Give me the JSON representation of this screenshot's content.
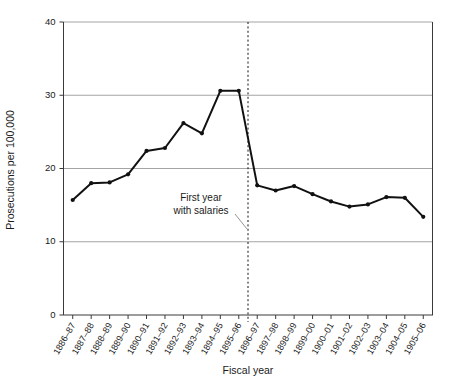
{
  "chart_data": {
    "type": "line",
    "title": "",
    "xlabel": "Fiscal year",
    "ylabel": "Prosecutions per 100,000",
    "ylim": [
      0,
      40
    ],
    "yticks": [
      0,
      10,
      20,
      30,
      40
    ],
    "ytick_labels": [
      "0",
      "10",
      "20",
      "30",
      "40"
    ],
    "grid": "horizontal",
    "legend": "none",
    "categories": [
      "1886–87",
      "1887–88",
      "1888–89",
      "1889–90",
      "1890–91",
      "1891–92",
      "1892–93",
      "1893–94",
      "1894–95",
      "1895–96",
      "1896–97",
      "1897–98",
      "1898–99",
      "1899–00",
      "1900–01",
      "1901–02",
      "1902–03",
      "1903–04",
      "1904–05",
      "1905–06"
    ],
    "values": [
      15.7,
      18.0,
      18.1,
      19.2,
      22.4,
      22.8,
      26.2,
      24.8,
      30.6,
      30.6,
      17.7,
      17.0,
      17.6,
      16.5,
      15.5,
      14.8,
      15.1,
      16.1,
      16.0,
      13.4
    ],
    "annotations": [
      {
        "name": "first-year-with-salaries",
        "line1": "First year",
        "line2": "with salaries",
        "marks_category": "1896–97"
      }
    ],
    "colors": {
      "series": "#111111",
      "grid": "#9a9a9a",
      "axis": "#3a3a3a",
      "event_line": "#111111",
      "background": "#ffffff"
    }
  }
}
